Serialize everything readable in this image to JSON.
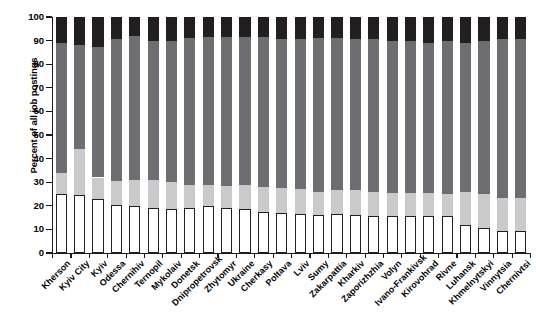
{
  "chart_data": {
    "type": "bar",
    "subtype": "stacked-percent-bar",
    "title": "",
    "xlabel": "",
    "ylabel": "Percent of all job postings",
    "ylim": [
      0,
      100
    ],
    "yticks": [
      0,
      10,
      20,
      30,
      40,
      50,
      60,
      70,
      80,
      90,
      100
    ],
    "grid": false,
    "legend": "none",
    "stack_order": "bottom-to-top",
    "categories": [
      "Kherson",
      "Kyiv City",
      "Kyiv",
      "Odessa",
      "Chernihiv",
      "Ternopil",
      "Mykolaiv",
      "Donetsk",
      "Dnipropetrovsk",
      "Zhytomyr",
      "Ukraine",
      "Cherkasy",
      "Poltava",
      "Lviv",
      "Sumy",
      "Zakarpattia",
      "Kharkiv",
      "Zaporizhzhia",
      "Volyn",
      "Ivano-Frankivsk",
      "Kirovohrad",
      "Rivne",
      "Luhansk",
      "Khmelnytskyi",
      "Vinnytsia",
      "Chernivtsi"
    ],
    "series": [
      {
        "name": "segment-white",
        "color": "#ffffff",
        "values": [
          25,
          24.5,
          23,
          20.5,
          20,
          19,
          18.5,
          19,
          20,
          19,
          18.5,
          17.5,
          17,
          16.5,
          16,
          16.5,
          16,
          15.5,
          15.5,
          15.5,
          15.5,
          15.5,
          12,
          10.5,
          9.5,
          9.5
        ]
      },
      {
        "name": "segment-light-gray",
        "color": "#c9cacc",
        "values": [
          9,
          19.5,
          9,
          10,
          11,
          12,
          11.5,
          10,
          9,
          9.5,
          10.5,
          10.5,
          10.5,
          10.5,
          10,
          10,
          10.5,
          10.5,
          10,
          10,
          10,
          9.5,
          14,
          14.5,
          14,
          14
        ]
      },
      {
        "name": "segment-dark-gray",
        "color": "#6d6e71",
        "values": [
          55,
          44,
          55.5,
          60,
          61,
          59,
          60,
          62,
          62.5,
          63,
          62.5,
          63.5,
          63,
          63.5,
          65,
          64.5,
          64,
          64.5,
          64.5,
          64.5,
          63.5,
          65,
          63,
          65,
          67,
          67
        ]
      },
      {
        "name": "segment-black",
        "color": "#231f20",
        "values": [
          11,
          12,
          12.5,
          9.5,
          8,
          10,
          10,
          9,
          8.5,
          8.5,
          8.5,
          8.5,
          9.5,
          9.5,
          9,
          9,
          9.5,
          9.5,
          10,
          10,
          11,
          10,
          11,
          10,
          9.5,
          9.5
        ]
      }
    ],
    "cumulative_tops": {
      "note": "Stacked top boundary of each segment, percent",
      "white": [
        25,
        24.5,
        23,
        20.5,
        20,
        19,
        18.5,
        19,
        20,
        19,
        18.5,
        17.5,
        17,
        16.5,
        16,
        16.5,
        16,
        15.5,
        15.5,
        15.5,
        15.5,
        15.5,
        12,
        10.5,
        9.5,
        9.5
      ],
      "light": [
        34,
        44,
        32,
        30.5,
        31,
        31,
        30,
        29,
        29,
        28.5,
        29,
        28,
        27.5,
        27,
        26,
        26.5,
        26.5,
        26,
        25.5,
        25.5,
        25.5,
        25,
        26,
        25,
        23.5,
        23.5
      ],
      "dark": [
        89,
        88,
        87.5,
        90.5,
        92,
        90,
        90,
        91,
        91.5,
        91.5,
        91.5,
        91.5,
        90.5,
        90.5,
        91,
        91,
        90.5,
        90.5,
        90,
        90,
        89,
        90,
        89,
        90,
        90.5,
        90.5
      ],
      "black": [
        100,
        100,
        100,
        100,
        100,
        100,
        100,
        100,
        100,
        100,
        100,
        100,
        100,
        100,
        100,
        100,
        100,
        100,
        100,
        100,
        100,
        100,
        100,
        100,
        100,
        100
      ]
    }
  }
}
